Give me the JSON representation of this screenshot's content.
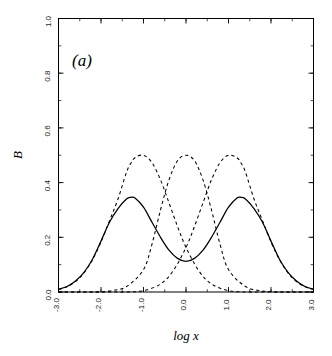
{
  "figure": {
    "panel_label": "(a)",
    "background": "#ffffff",
    "line_color": "#000000"
  },
  "axes": {
    "x_title": "log x",
    "y_title": "B",
    "x_ticklabels": [
      "-3.0",
      "-2.0",
      "-1.0",
      "0.0",
      "1.0",
      "2.0",
      "3.0"
    ],
    "y_ticklabels": [
      "0.0",
      "0.2",
      "0.4",
      "0.6",
      "0.8",
      "1.0"
    ]
  },
  "chart_data": {
    "type": "line",
    "title": "",
    "subtitle": "",
    "panel": "(a)",
    "xlabel": "log x",
    "ylabel": "B",
    "xlim": [
      -3.0,
      3.0
    ],
    "ylim": [
      0.0,
      1.0
    ],
    "xticks": [
      -3.0,
      -2.0,
      -1.0,
      0.0,
      1.0,
      2.0,
      3.0
    ],
    "yticks": [
      0.0,
      0.2,
      0.4,
      0.6,
      0.8,
      1.0
    ],
    "x_minor_tick_interval": 0.5,
    "y_minor_tick_interval": 0.1,
    "grid": false,
    "legend": false,
    "legend_position": "none",
    "annotations": [
      {
        "text": "(a)",
        "x": -2.35,
        "y": 0.86,
        "style": "italic-serif"
      }
    ],
    "series": [
      {
        "name": "component-1",
        "style": "dashed",
        "color": "#000000",
        "peak_x": -1.3,
        "peak_y": 0.5,
        "sigma": 0.55,
        "x": [
          -3.0,
          -2.8,
          -2.6,
          -2.4,
          -2.2,
          -2.0,
          -1.8,
          -1.6,
          -1.4,
          -1.3,
          -1.2,
          -1.0,
          -0.8,
          -0.6,
          -0.4,
          -0.2,
          0.0,
          0.3,
          0.6,
          1.0,
          1.4,
          1.8,
          2.2,
          2.6,
          3.0
        ],
        "values": [
          0.009,
          0.019,
          0.038,
          0.07,
          0.118,
          0.183,
          0.261,
          0.34,
          0.438,
          0.47,
          0.491,
          0.5,
          0.473,
          0.41,
          0.326,
          0.24,
          0.163,
          0.078,
          0.029,
          0.005,
          0.0,
          0.0,
          0.0,
          0.0,
          0.0
        ]
      },
      {
        "name": "component-2",
        "style": "dashed",
        "color": "#000000",
        "peak_x": 0.0,
        "peak_y": 0.5,
        "sigma": 0.55,
        "x": [
          -3.0,
          -2.6,
          -2.2,
          -1.8,
          -1.4,
          -1.0,
          -0.8,
          -0.6,
          -0.4,
          -0.2,
          0.0,
          0.2,
          0.4,
          0.6,
          0.8,
          1.0,
          1.4,
          1.8,
          2.2,
          2.6,
          3.0
        ],
        "values": [
          0.0,
          0.0,
          0.0,
          0.004,
          0.02,
          0.082,
          0.175,
          0.3,
          0.41,
          0.48,
          0.5,
          0.48,
          0.41,
          0.3,
          0.175,
          0.082,
          0.02,
          0.004,
          0.0,
          0.0,
          0.0
        ]
      },
      {
        "name": "component-3",
        "style": "dashed",
        "color": "#000000",
        "peak_x": 1.3,
        "peak_y": 0.5,
        "sigma": 0.55,
        "x": [
          -3.0,
          -2.6,
          -2.2,
          -1.8,
          -1.4,
          -1.0,
          -0.6,
          -0.3,
          0.0,
          0.2,
          0.4,
          0.6,
          0.8,
          1.0,
          1.2,
          1.3,
          1.4,
          1.6,
          1.8,
          2.0,
          2.2,
          2.4,
          2.6,
          2.8,
          3.0
        ],
        "values": [
          0.0,
          0.0,
          0.0,
          0.0,
          0.0,
          0.005,
          0.029,
          0.078,
          0.163,
          0.24,
          0.326,
          0.41,
          0.473,
          0.5,
          0.491,
          0.47,
          0.438,
          0.34,
          0.261,
          0.183,
          0.118,
          0.07,
          0.038,
          0.019,
          0.009
        ]
      },
      {
        "name": "total",
        "style": "solid",
        "color": "#000000",
        "peaks": [
          {
            "x": -1.3,
            "y": 0.255
          },
          {
            "x": 1.3,
            "y": 0.255
          }
        ],
        "local_minimum": {
          "x": 0.0,
          "y": 0.095
        },
        "x": [
          -3.0,
          -2.8,
          -2.6,
          -2.4,
          -2.2,
          -2.0,
          -1.8,
          -1.6,
          -1.4,
          -1.3,
          -1.2,
          -1.0,
          -0.8,
          -0.6,
          -0.4,
          -0.2,
          0.0,
          0.2,
          0.4,
          0.6,
          0.8,
          1.0,
          1.2,
          1.3,
          1.4,
          1.6,
          1.8,
          2.0,
          2.2,
          2.4,
          2.6,
          2.8,
          3.0
        ],
        "values": [
          0.01,
          0.02,
          0.04,
          0.072,
          0.12,
          0.186,
          0.255,
          0.305,
          0.34,
          0.346,
          0.344,
          0.31,
          0.255,
          0.2,
          0.153,
          0.123,
          0.112,
          0.123,
          0.153,
          0.2,
          0.255,
          0.31,
          0.344,
          0.346,
          0.34,
          0.305,
          0.255,
          0.186,
          0.12,
          0.072,
          0.04,
          0.02,
          0.01
        ]
      }
    ]
  }
}
